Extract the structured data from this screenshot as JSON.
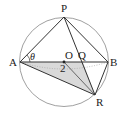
{
  "figure": {
    "points": {
      "A": {
        "label": "A",
        "x": 20,
        "y": 62
      },
      "B": {
        "label": "B",
        "x": 108,
        "y": 62
      },
      "P": {
        "label": "P",
        "x": 64,
        "y": 17
      },
      "R": {
        "label": "R",
        "x": 95,
        "y": 95
      },
      "O": {
        "label": "O",
        "x": 64,
        "y": 62
      },
      "Q": {
        "label": "Q",
        "x": 83,
        "y": 62
      }
    },
    "angle_label": "θ",
    "length_label": "2",
    "colors": {
      "stroke": "#333333",
      "circle": "#888888",
      "shade": "#d9d9d9"
    }
  }
}
